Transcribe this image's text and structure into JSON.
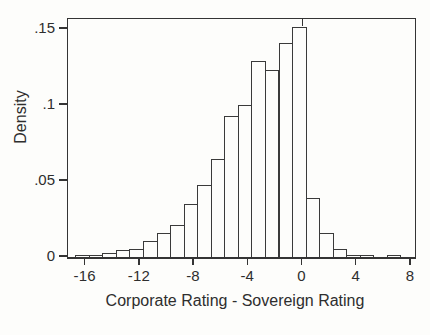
{
  "figure": {
    "background_color": "#fdfdfb",
    "line_color": "#343434",
    "text_color": "#2e2e2e"
  },
  "chart_data": {
    "type": "bar",
    "subtype": "histogram",
    "title": "",
    "xlabel": "Corporate Rating - Sovereign Rating",
    "ylabel": "Density",
    "xlim": [
      -17.3,
      8.3
    ],
    "ylim": [
      0,
      0.1566
    ],
    "grid": false,
    "legend": "none",
    "bar_fill": "#fdfdfb",
    "bar_outline": "#3a3a3a",
    "x_ticks": [
      {
        "value": -16,
        "label": "-16"
      },
      {
        "value": -12,
        "label": "-12"
      },
      {
        "value": -8,
        "label": "-8"
      },
      {
        "value": -4,
        "label": "-4"
      },
      {
        "value": 0,
        "label": "0"
      },
      {
        "value": 4,
        "label": "4"
      },
      {
        "value": 8,
        "label": "8"
      }
    ],
    "y_ticks": [
      {
        "value": 0,
        "label": "0"
      },
      {
        "value": 0.05,
        "label": ".05"
      },
      {
        "value": 0.1,
        "label": ".1"
      },
      {
        "value": 0.15,
        "label": ".15"
      }
    ],
    "top_tick_value": 0,
    "bins": {
      "start": -16.77,
      "width": 1,
      "densities": [
        0.0012,
        0.0013,
        0.0025,
        0.0046,
        0.0053,
        0.0105,
        0.016,
        0.021,
        0.035,
        0.0475,
        0.0645,
        0.093,
        0.1,
        0.129,
        0.123,
        0.141,
        0.1513,
        0.039,
        0.0155,
        0.005,
        0.0013,
        0.0013,
        0,
        0.0013
      ]
    }
  }
}
